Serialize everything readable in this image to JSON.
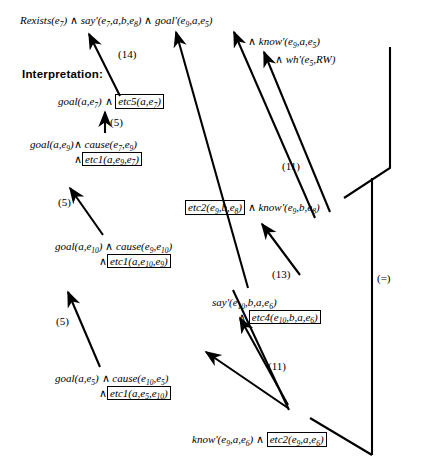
{
  "figure": {
    "type": "proof-graph",
    "heading": "Interpretation:",
    "background": "#ffffff",
    "ink": "#000000"
  },
  "top_formula": {
    "segment_1": "Rexists(e",
    "s1_sub": "7",
    "segment_1_tail": ")",
    "and_1": "∧",
    "segment_2": "say'(e",
    "s2_sub": "7",
    "segment_2_tail": ",a,b,e",
    "s2_sub_b": "8",
    "segment_2_end": ")",
    "and_2": "∧",
    "segment_3": "goal'(e",
    "s3_sub": "9",
    "segment_3_tail": ",a,e",
    "s3_sub_b": "5",
    "segment_3_end": ")",
    "line2_and": "∧",
    "line2": "know'(e",
    "l2_sub": "9",
    "line2_tail": ",a,e",
    "l2_sub_b": "5",
    "line2_end": ")",
    "line3_and": "∧",
    "line3": "wh'(e",
    "l3_sub": "5",
    "line3_tail": ",RW)"
  },
  "nodes": [
    {
      "id": "node-goal-e7",
      "name": "node-goal-e7",
      "lines": [
        {
          "parts": [
            {
              "t": "text",
              "v": "goal(a,e"
            },
            {
              "t": "sub",
              "v": "7"
            },
            {
              "t": "text",
              "v": ")"
            },
            {
              "t": "conn",
              "v": " ∧ "
            },
            {
              "t": "box",
              "v": "etc5(a,e",
              "sub": "7",
              "tail": ")"
            }
          ]
        }
      ]
    },
    {
      "id": "node-goal-e9",
      "name": "node-goal-e9",
      "lines": [
        {
          "parts": [
            {
              "t": "text",
              "v": "goal(a,e"
            },
            {
              "t": "sub",
              "v": "9"
            },
            {
              "t": "text",
              "v": ")"
            },
            {
              "t": "conn",
              "v": "∧ "
            },
            {
              "t": "text",
              "v": "cause(e"
            },
            {
              "t": "sub",
              "v": "7"
            },
            {
              "t": "text",
              "v": ",e"
            },
            {
              "t": "sub",
              "v": "9"
            },
            {
              "t": "text",
              "v": ")"
            }
          ]
        },
        {
          "indent": 2,
          "parts": [
            {
              "t": "conn",
              "v": "∧"
            },
            {
              "t": "box",
              "v": "etc1(a,e",
              "sub": "9",
              "mid": ",e",
              "sub2": "7",
              "tail": ")"
            }
          ]
        }
      ]
    },
    {
      "id": "node-goal-e10",
      "name": "node-goal-e10",
      "lines": [
        {
          "parts": [
            {
              "t": "text",
              "v": "goal(a,e"
            },
            {
              "t": "sub",
              "v": "10"
            },
            {
              "t": "text",
              "v": ")"
            },
            {
              "t": "conn",
              "v": " ∧ "
            },
            {
              "t": "text",
              "v": "cause(e"
            },
            {
              "t": "sub",
              "v": "9"
            },
            {
              "t": "text",
              "v": ",e"
            },
            {
              "t": "sub",
              "v": "10"
            },
            {
              "t": "text",
              "v": ")"
            }
          ]
        },
        {
          "indent": 2,
          "parts": [
            {
              "t": "conn",
              "v": "∧"
            },
            {
              "t": "box",
              "v": "etc1(a,e",
              "sub": "10",
              "mid": ",e",
              "sub2": "9",
              "tail": ")"
            }
          ]
        }
      ]
    },
    {
      "id": "node-goal-e5",
      "name": "node-goal-e5",
      "lines": [
        {
          "parts": [
            {
              "t": "text",
              "v": "goal(a,e"
            },
            {
              "t": "sub",
              "v": "5"
            },
            {
              "t": "text",
              "v": ")"
            },
            {
              "t": "conn",
              "v": " ∧ "
            },
            {
              "t": "text",
              "v": "cause(e"
            },
            {
              "t": "sub",
              "v": "10"
            },
            {
              "t": "text",
              "v": ",e"
            },
            {
              "t": "sub",
              "v": "5"
            },
            {
              "t": "text",
              "v": ")"
            }
          ]
        },
        {
          "indent": 2,
          "parts": [
            {
              "t": "conn",
              "v": "∧"
            },
            {
              "t": "box",
              "v": "etc1(a,e",
              "sub": "5",
              "mid": ",e",
              "sub2": "10",
              "tail": ")"
            }
          ]
        }
      ]
    },
    {
      "id": "node-etc2-know",
      "name": "node-etc2-know-e9-b-e8",
      "lines": [
        {
          "parts": [
            {
              "t": "box",
              "v": "etc2(e",
              "sub": "9",
              "mid": ",b,e",
              "sub2": "8",
              "tail": ")"
            },
            {
              "t": "conn",
              "v": " ∧ "
            },
            {
              "t": "text",
              "v": "know'(e"
            },
            {
              "t": "sub",
              "v": "9"
            },
            {
              "t": "text",
              "v": ",b,e"
            },
            {
              "t": "sub",
              "v": "8"
            },
            {
              "t": "text",
              "v": ")"
            }
          ]
        }
      ]
    },
    {
      "id": "node-say-e10",
      "name": "node-say-e10",
      "lines": [
        {
          "parts": [
            {
              "t": "text",
              "v": "say'(e"
            },
            {
              "t": "sub",
              "v": "10"
            },
            {
              "t": "text",
              "v": ",b,a,e"
            },
            {
              "t": "sub",
              "v": "6"
            },
            {
              "t": "text",
              "v": ")"
            }
          ]
        },
        {
          "indent": 1,
          "parts": [
            {
              "t": "conn",
              "v": "∧ "
            },
            {
              "t": "box",
              "v": "etc4(e",
              "sub": "10",
              "mid": ",b,a,e",
              "sub2": "6",
              "tail": ")"
            }
          ]
        }
      ]
    },
    {
      "id": "node-know-e9-a-e6",
      "name": "node-know-e9-a-e6",
      "lines": [
        {
          "parts": [
            {
              "t": "text",
              "v": "know'(e"
            },
            {
              "t": "sub",
              "v": "9"
            },
            {
              "t": "text",
              "v": ",a,e"
            },
            {
              "t": "sub",
              "v": "6"
            },
            {
              "t": "text",
              "v": ")"
            },
            {
              "t": "conn",
              "v": " ∧ "
            },
            {
              "t": "box",
              "v": "etc2(e",
              "sub": "9",
              "mid": ",a,e",
              "sub2": "6",
              "tail": ")"
            }
          ]
        }
      ]
    }
  ],
  "edge_labels": [
    {
      "id": "label-14",
      "text": "(14)"
    },
    {
      "id": "label-5-a",
      "text": "(5)"
    },
    {
      "id": "label-5-b",
      "text": "(5)"
    },
    {
      "id": "label-5-c",
      "text": "(5)"
    },
    {
      "id": "label-11-a",
      "text": "(11)"
    },
    {
      "id": "label-13",
      "text": "(13)"
    },
    {
      "id": "label-11-b",
      "text": "(11)"
    },
    {
      "id": "label-eq",
      "text": "(=)"
    }
  ]
}
